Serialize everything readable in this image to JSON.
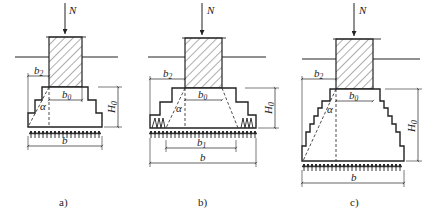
{
  "figures": [
    {
      "id": "a",
      "caption": "a)",
      "labels": {
        "load": "N",
        "b2": "b",
        "b2_sub": "2",
        "b0": "b",
        "b0_sub": "0",
        "alpha": "α",
        "H0": "H",
        "H0_sub": "0",
        "b": "b"
      }
    },
    {
      "id": "b",
      "caption": "b)",
      "labels": {
        "load": "N",
        "b2": "b",
        "b2_sub": "2",
        "b0": "b",
        "b0_sub": "0",
        "alpha": "α",
        "H0": "H",
        "H0_sub": "0",
        "b1": "b",
        "b1_sub": "1",
        "b": "b"
      }
    },
    {
      "id": "c",
      "caption": "c)",
      "labels": {
        "load": "N",
        "b2": "b",
        "b2_sub": "2",
        "b0": "b",
        "b0_sub": "0",
        "alpha": "α",
        "H0": "H",
        "H0_sub": "0",
        "b": "b"
      }
    }
  ],
  "colors": {
    "line": "#222222",
    "background": "#ffffff"
  }
}
